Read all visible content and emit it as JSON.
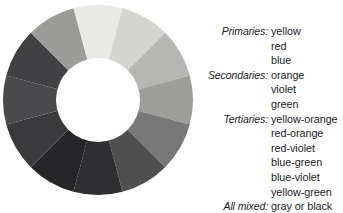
{
  "figure": {
    "background": "#ffffff"
  },
  "wheel": {
    "name": "grayscale-color-wheel",
    "type": "donut",
    "segments": 12,
    "center_x": 96,
    "center_y": 98,
    "outer_radius": 95,
    "inner_radius": 42,
    "hole_color": "#ffffff",
    "slices": [
      {
        "name": "yellow",
        "angle_start": -105,
        "angle_end": -75,
        "color": "#e9e9e7"
      },
      {
        "name": "yellow-orange",
        "angle_start": -75,
        "angle_end": -45,
        "color": "#d4d4d2"
      },
      {
        "name": "orange",
        "angle_start": -45,
        "angle_end": -15,
        "color": "#b6b6b4"
      },
      {
        "name": "red-orange",
        "angle_start": -15,
        "angle_end": 15,
        "color": "#9d9d9b"
      },
      {
        "name": "red",
        "angle_start": 15,
        "angle_end": 45,
        "color": "#787878"
      },
      {
        "name": "red-violet",
        "angle_start": 45,
        "angle_end": 75,
        "color": "#4f4f50"
      },
      {
        "name": "violet",
        "angle_start": 75,
        "angle_end": 105,
        "color": "#2f2f31"
      },
      {
        "name": "blue-violet",
        "angle_start": 105,
        "angle_end": 135,
        "color": "#262628"
      },
      {
        "name": "blue",
        "angle_start": 135,
        "angle_end": 165,
        "color": "#3a3a3c"
      },
      {
        "name": "blue-green",
        "angle_start": 165,
        "angle_end": 195,
        "color": "#4a4a4c"
      },
      {
        "name": "green",
        "angle_start": 195,
        "angle_end": 225,
        "color": "#414143"
      },
      {
        "name": "yellow-green",
        "angle_start": 225,
        "angle_end": 255,
        "color": "#9b9b99"
      }
    ]
  },
  "legend": {
    "name": "color-category-legend",
    "rows": [
      {
        "label": "Primaries:",
        "value": "yellow"
      },
      {
        "label": "",
        "value": "red"
      },
      {
        "label": "",
        "value": "blue"
      },
      {
        "label": "Secondaries:",
        "value": "orange"
      },
      {
        "label": "",
        "value": "violet"
      },
      {
        "label": "",
        "value": "green"
      },
      {
        "label": "Tertiaries:",
        "value": "yellow-orange"
      },
      {
        "label": "",
        "value": "red-orange"
      },
      {
        "label": "",
        "value": "red-violet"
      },
      {
        "label": "",
        "value": "blue-green"
      },
      {
        "label": "",
        "value": "blue-violet"
      },
      {
        "label": "",
        "value": "yellow-green"
      },
      {
        "label": "All mixed:",
        "value": "gray or black"
      }
    ]
  },
  "chart_data": {
    "type": "pie",
    "title": "",
    "subtype": "donut",
    "categories": [
      "yellow",
      "yellow-orange",
      "orange",
      "red-orange",
      "red",
      "red-violet",
      "violet",
      "blue-violet",
      "blue",
      "blue-green",
      "green",
      "yellow-green"
    ],
    "values": [
      1,
      1,
      1,
      1,
      1,
      1,
      1,
      1,
      1,
      1,
      1,
      1
    ],
    "colors": [
      "#e9e9e7",
      "#d4d4d2",
      "#b6b6b4",
      "#9d9d9b",
      "#787878",
      "#4f4f50",
      "#2f2f31",
      "#262628",
      "#3a3a3c",
      "#4a4a4c",
      "#414143",
      "#9b9b99"
    ],
    "xlabel": "",
    "ylabel": "",
    "legend_position": "right",
    "grid": false
  }
}
